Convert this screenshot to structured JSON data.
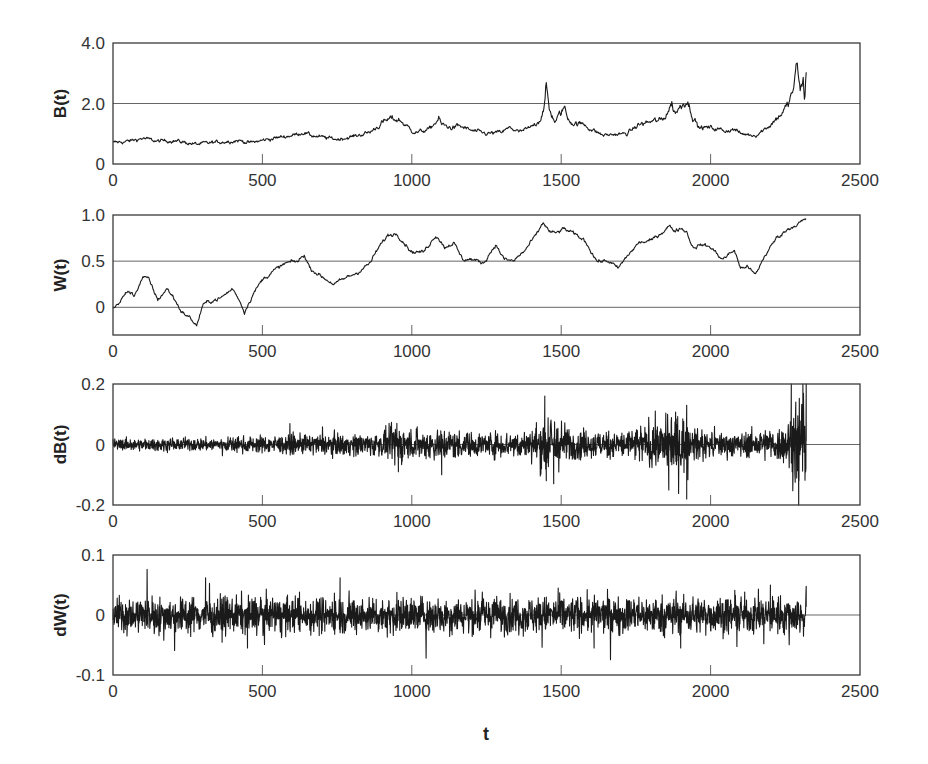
{
  "figure": {
    "x_axis_label": "t",
    "x_ticks": [
      "0",
      "500",
      "1000",
      "1500",
      "2000",
      "2500"
    ]
  },
  "chart_data": [
    {
      "type": "line",
      "id": "B",
      "ylabel": "B(t)",
      "xlabel": "",
      "xlim": [
        0,
        2500
      ],
      "ylim": [
        0,
        4.0
      ],
      "y_ticks": [
        "0",
        "2.0",
        "4.0"
      ],
      "y_tick_values": [
        0,
        2.0,
        4.0
      ],
      "gridlines": [
        2.0
      ],
      "grid": "horizontal at 2.0",
      "series": [
        {
          "name": "B(t)",
          "x": [
            0,
            50,
            100,
            150,
            200,
            280,
            350,
            420,
            460,
            520,
            600,
            640,
            660,
            700,
            750,
            800,
            860,
            900,
            930,
            960,
            1000,
            1020,
            1060,
            1090,
            1100,
            1130,
            1160,
            1200,
            1250,
            1300,
            1330,
            1360,
            1400,
            1430,
            1445,
            1450,
            1460,
            1480,
            1500,
            1510,
            1520,
            1540,
            1580,
            1600,
            1640,
            1680,
            1720,
            1760,
            1800,
            1840,
            1870,
            1880,
            1900,
            1920,
            1940,
            1960,
            2000,
            2050,
            2080,
            2100,
            2150,
            2180,
            2200,
            2230,
            2260,
            2280,
            2290,
            2300,
            2310,
            2315,
            2320
          ],
          "values": [
            0.7,
            0.75,
            0.85,
            0.75,
            0.78,
            0.65,
            0.72,
            0.78,
            0.7,
            0.82,
            0.95,
            1.05,
            0.95,
            0.88,
            0.82,
            0.9,
            1.05,
            1.35,
            1.5,
            1.45,
            1.1,
            1.05,
            1.15,
            1.5,
            1.3,
            1.2,
            1.25,
            1.1,
            1.0,
            1.05,
            1.2,
            1.05,
            1.2,
            1.5,
            2.0,
            2.55,
            1.8,
            1.4,
            1.7,
            1.9,
            1.55,
            1.35,
            1.3,
            1.15,
            0.95,
            0.98,
            1.0,
            1.3,
            1.4,
            1.45,
            2.0,
            1.7,
            1.9,
            2.15,
            1.6,
            1.2,
            1.2,
            1.1,
            1.15,
            1.0,
            0.95,
            1.15,
            1.3,
            1.6,
            1.95,
            2.6,
            3.35,
            2.4,
            2.7,
            2.1,
            3.2
          ]
        }
      ]
    },
    {
      "type": "line",
      "id": "W",
      "ylabel": "W(t)",
      "xlabel": "",
      "xlim": [
        0,
        2500
      ],
      "ylim": [
        -0.3,
        1.0
      ],
      "y_ticks": [
        "0",
        "0.5",
        "1.0"
      ],
      "y_tick_values": [
        0,
        0.5,
        1.0
      ],
      "gridlines": [
        0,
        0.5
      ],
      "grid": "horizontal at 0 and 0.5",
      "series": [
        {
          "name": "W(t)",
          "x": [
            0,
            20,
            50,
            70,
            100,
            120,
            150,
            180,
            200,
            230,
            260,
            280,
            300,
            320,
            360,
            400,
            420,
            440,
            450,
            470,
            500,
            540,
            580,
            620,
            640,
            660,
            700,
            740,
            780,
            820,
            860,
            890,
            920,
            950,
            980,
            1000,
            1040,
            1080,
            1090,
            1110,
            1140,
            1170,
            1200,
            1240,
            1280,
            1310,
            1340,
            1380,
            1420,
            1440,
            1460,
            1480,
            1510,
            1540,
            1580,
            1620,
            1660,
            1690,
            1720,
            1760,
            1800,
            1840,
            1860,
            1880,
            1900,
            1920,
            1940,
            1970,
            2000,
            2040,
            2080,
            2100,
            2120,
            2150,
            2180,
            2220,
            2260,
            2300,
            2320
          ],
          "values": [
            -0.02,
            0.05,
            0.18,
            0.12,
            0.33,
            0.3,
            0.08,
            0.2,
            0.12,
            -0.05,
            -0.12,
            -0.2,
            0.02,
            0.06,
            0.1,
            0.2,
            0.1,
            -0.05,
            0.02,
            0.15,
            0.3,
            0.4,
            0.48,
            0.5,
            0.57,
            0.42,
            0.33,
            0.25,
            0.32,
            0.38,
            0.48,
            0.65,
            0.78,
            0.8,
            0.68,
            0.6,
            0.6,
            0.78,
            0.75,
            0.65,
            0.7,
            0.52,
            0.52,
            0.48,
            0.68,
            0.52,
            0.5,
            0.62,
            0.8,
            0.92,
            0.82,
            0.8,
            0.85,
            0.8,
            0.72,
            0.5,
            0.5,
            0.42,
            0.55,
            0.7,
            0.72,
            0.82,
            0.88,
            0.83,
            0.86,
            0.82,
            0.65,
            0.68,
            0.65,
            0.52,
            0.62,
            0.42,
            0.45,
            0.35,
            0.55,
            0.75,
            0.85,
            0.92,
            0.95
          ]
        }
      ]
    },
    {
      "type": "line",
      "id": "dB",
      "ylabel": "dB(t)",
      "xlabel": "",
      "xlim": [
        0,
        2500
      ],
      "ylim": [
        -0.2,
        0.2
      ],
      "y_ticks": [
        "-0.2",
        "0",
        "0.2"
      ],
      "y_tick_values": [
        -0.2,
        0,
        0.2
      ],
      "gridlines": [
        0
      ],
      "grid": "horizontal at 0",
      "n_points": 2320,
      "envelope_x": [
        0,
        300,
        600,
        900,
        950,
        1000,
        1100,
        1200,
        1400,
        1450,
        1500,
        1550,
        1700,
        1850,
        1900,
        1950,
        2100,
        2250,
        2280,
        2300,
        2320
      ],
      "envelope_amp": [
        0.012,
        0.014,
        0.02,
        0.025,
        0.045,
        0.03,
        0.035,
        0.025,
        0.03,
        0.07,
        0.05,
        0.03,
        0.03,
        0.055,
        0.07,
        0.03,
        0.025,
        0.04,
        0.09,
        0.11,
        0.08
      ],
      "spikes": [
        {
          "x": 950,
          "value": 0.07
        },
        {
          "x": 955,
          "value": -0.09
        },
        {
          "x": 1100,
          "value": -0.1
        },
        {
          "x": 1445,
          "value": 0.16
        },
        {
          "x": 1450,
          "value": -0.12
        },
        {
          "x": 1475,
          "value": -0.13
        },
        {
          "x": 1860,
          "value": -0.15
        },
        {
          "x": 1920,
          "value": 0.13
        },
        {
          "x": 1920,
          "value": -0.18
        },
        {
          "x": 2270,
          "value": 0.2
        },
        {
          "x": 2285,
          "value": 0.14
        },
        {
          "x": 2295,
          "value": -0.2
        },
        {
          "x": 2320,
          "value": 0.2
        }
      ]
    },
    {
      "type": "line",
      "id": "dW",
      "ylabel": "dW(t)",
      "xlabel": "t",
      "xlim": [
        0,
        2500
      ],
      "ylim": [
        -0.1,
        0.1
      ],
      "y_ticks": [
        "-0.1",
        "0",
        "0.1"
      ],
      "y_tick_values": [
        -0.1,
        0,
        0.1
      ],
      "gridlines": [
        0
      ],
      "grid": "horizontal at 0",
      "n_points": 2320,
      "envelope_x": [
        0,
        2320
      ],
      "envelope_amp": [
        0.02,
        0.02
      ],
      "spikes": [
        {
          "x": 310,
          "value": 0.062
        },
        {
          "x": 450,
          "value": -0.055
        },
        {
          "x": 760,
          "value": 0.062
        },
        {
          "x": 1490,
          "value": 0.045
        },
        {
          "x": 1610,
          "value": -0.055
        },
        {
          "x": 1900,
          "value": -0.055
        },
        {
          "x": 2200,
          "value": 0.05
        },
        {
          "x": 2320,
          "value": 0.048
        }
      ]
    }
  ]
}
